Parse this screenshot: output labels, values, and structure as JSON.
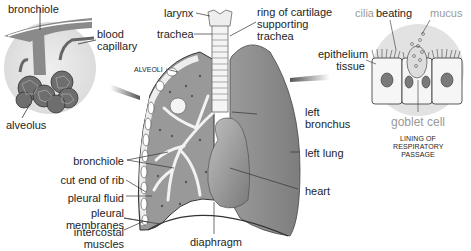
{
  "colors": {
    "background": "#ffffff",
    "lung_dark": "#8c8c8c",
    "lung_light": "#b5b5b5",
    "airway_light": "#f0f0f0",
    "inset_circle": "#e3e3e3",
    "line": "#333333",
    "label_grey": "#9a9a9a"
  },
  "labels": {
    "bronchiole_top": "bronchiole",
    "blood_capillary_1": "blood",
    "blood_capillary_2": "capillary",
    "alveolus": "alveolus",
    "larynx": "larynx",
    "trachea": "trachea",
    "ring_1": "ring of cartilage",
    "ring_2": "supporting",
    "ring_3": "trachea",
    "alveoli": "ALVEOLI",
    "cilia": "cilia",
    "beating": "beating",
    "mucus": "mucus",
    "epithelium_1": "epithelium",
    "epithelium_2": "tissue",
    "goblet_cell": "goblet cell",
    "lining_1": "LINING OF",
    "lining_2": "RESPIRATORY",
    "lining_3": "PASSAGE",
    "left_bronchus_1": "left",
    "left_bronchus_2": "bronchus",
    "left_lung": "left lung",
    "heart": "heart",
    "bronchiole_mid": "bronchiole",
    "cut_end_of_rib": "cut end of rib",
    "pleural_fluid": "pleural fluid",
    "pleural_membranes_1": "pleural",
    "pleural_membranes_2": "membranes",
    "intercostal_1": "intercostal",
    "intercostal_2": "muscles",
    "diaphragm": "diaphragm"
  }
}
